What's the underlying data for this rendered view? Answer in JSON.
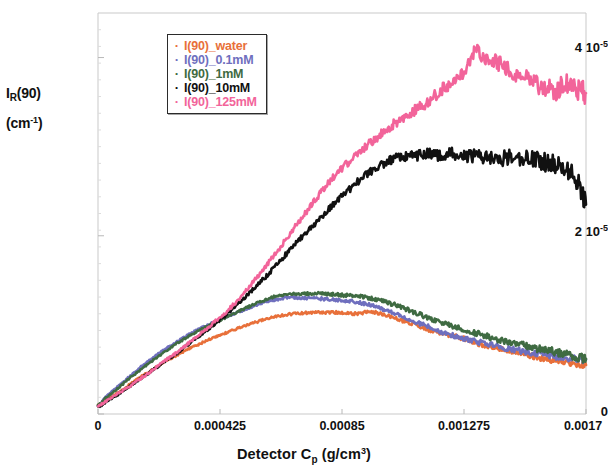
{
  "chart_data": {
    "type": "line",
    "title": "",
    "xlabel": "Detector C_p (g/cm^3)",
    "xlabel_parts": {
      "pre": "Detector C",
      "sub": "p",
      "mid": " (g/cm",
      "sup": "3",
      "post": ")"
    },
    "ylabel": "I_R(90) (cm^-1)",
    "ylabel_parts": {
      "line1_pre": "I",
      "line1_sub": "R",
      "line1_post": "(90)",
      "line2_pre": "(cm",
      "line2_sup": "-1",
      "line2_post": ")"
    },
    "xlim": [
      0,
      0.0017
    ],
    "ylim": [
      0,
      4.5e-05
    ],
    "grid": false,
    "xticks": [
      0,
      0.000425,
      0.00085,
      0.001275,
      0.0017
    ],
    "xticklabels": [
      "0",
      "0.000425",
      "0.00085",
      "0.001275",
      "0.0017"
    ],
    "yticks": [
      0,
      2e-05,
      4e-05
    ],
    "yticklabels": [
      "0",
      "2 10-5",
      "4 10-5"
    ],
    "ytick_display": [
      {
        "mantissa": "0",
        "exp": ""
      },
      {
        "mantissa": "2 10",
        "exp": "-5"
      },
      {
        "mantissa": "4 10",
        "exp": "-5"
      }
    ],
    "legend_position": "upper left inside",
    "series": [
      {
        "name": "I(90)_water",
        "color": "#e8703a",
        "x": [
          0,
          3e-05,
          7e-05,
          0.00011,
          0.00015,
          0.00019,
          0.00023,
          0.00027,
          0.00031,
          0.00035,
          0.00039,
          0.00043,
          0.00047,
          0.00051,
          0.00055,
          0.00059,
          0.00063,
          0.00067,
          0.00071,
          0.00075,
          0.00079,
          0.00083,
          0.00087,
          0.00091,
          0.00095,
          0.00099,
          0.00103,
          0.00107,
          0.00111,
          0.00115,
          0.00119,
          0.00123,
          0.00127,
          0.00131,
          0.00135,
          0.00139,
          0.00143,
          0.00147,
          0.00151,
          0.00155,
          0.00159,
          0.00163,
          0.00167,
          0.0017
        ],
        "y": [
          1e-06,
          1.6e-06,
          2.4e-06,
          3.3e-06,
          4.2e-06,
          5e-06,
          5.8e-06,
          6.5e-06,
          7.2e-06,
          7.8e-06,
          8.4e-06,
          8.9e-06,
          9.4e-06,
          9.9e-06,
          1.03e-05,
          1.07e-05,
          1.1e-05,
          1.12e-05,
          1.13e-05,
          1.14e-05,
          1.14e-05,
          1.14e-05,
          1.13e-05,
          1.13e-05,
          1.15e-05,
          1.12e-05,
          1.08e-05,
          1.04e-05,
          1e-05,
          9.5e-06,
          9.1e-06,
          8.8e-06,
          8.5e-06,
          8e-06,
          7.7e-06,
          7.4e-06,
          7.1e-06,
          6.8e-06,
          6.5e-06,
          6.2e-06,
          6e-06,
          5.8e-06,
          5.6e-06,
          5.5e-06
        ]
      },
      {
        "name": "I(90)_0.1mM",
        "color": "#6f6fbe",
        "x": [
          0,
          3e-05,
          7e-05,
          0.00011,
          0.00015,
          0.00019,
          0.00023,
          0.00027,
          0.00031,
          0.00035,
          0.00039,
          0.00043,
          0.00047,
          0.00051,
          0.00055,
          0.00059,
          0.00063,
          0.00067,
          0.00071,
          0.00075,
          0.00079,
          0.00083,
          0.00087,
          0.00091,
          0.00095,
          0.00099,
          0.00103,
          0.00107,
          0.00111,
          0.00115,
          0.00119,
          0.00123,
          0.00127,
          0.00131,
          0.00135,
          0.00139,
          0.00143,
          0.00147,
          0.00151,
          0.00155,
          0.00159,
          0.00163,
          0.00167,
          0.0017
        ],
        "y": [
          1e-06,
          2e-06,
          3.1e-06,
          4.2e-06,
          5.3e-06,
          6.3e-06,
          7.2e-06,
          8e-06,
          8.8e-06,
          9.5e-06,
          1.01e-05,
          1.07e-05,
          1.12e-05,
          1.17e-05,
          1.22e-05,
          1.26e-05,
          1.29e-05,
          1.31e-05,
          1.3e-05,
          1.3e-05,
          1.29e-05,
          1.28e-05,
          1.27e-05,
          1.25e-05,
          1.22e-05,
          1.18e-05,
          1.13e-05,
          1.08e-05,
          1.03e-05,
          9.8e-06,
          9.3e-06,
          8.9e-06,
          8.5e-06,
          8.2e-06,
          7.9e-06,
          7.6e-06,
          7.3e-06,
          7.1e-06,
          6.9e-06,
          6.7e-06,
          6.5e-06,
          6.3e-06,
          6.2e-06,
          6.1e-06
        ]
      },
      {
        "name": "I(90)_1mM",
        "color": "#3f6b42",
        "x": [
          0,
          3e-05,
          7e-05,
          0.00011,
          0.00015,
          0.00019,
          0.00023,
          0.00027,
          0.00031,
          0.00035,
          0.00039,
          0.00043,
          0.00047,
          0.00051,
          0.00055,
          0.00059,
          0.00063,
          0.00067,
          0.00071,
          0.00075,
          0.00079,
          0.00083,
          0.00087,
          0.00091,
          0.00095,
          0.00099,
          0.00103,
          0.00107,
          0.00111,
          0.00115,
          0.00119,
          0.00123,
          0.00127,
          0.00131,
          0.00135,
          0.00139,
          0.00143,
          0.00147,
          0.00151,
          0.00155,
          0.00159,
          0.00163,
          0.00167,
          0.0017
        ],
        "y": [
          1e-06,
          1.9e-06,
          2.9e-06,
          4e-06,
          5e-06,
          6e-06,
          6.9e-06,
          7.8e-06,
          8.6e-06,
          9.3e-06,
          1e-05,
          1.06e-05,
          1.12e-05,
          1.18e-05,
          1.24e-05,
          1.29e-05,
          1.33e-05,
          1.35e-05,
          1.35e-05,
          1.35e-05,
          1.35e-05,
          1.34e-05,
          1.33e-05,
          1.32e-05,
          1.3e-05,
          1.27e-05,
          1.23e-05,
          1.18e-05,
          1.13e-05,
          1.08e-05,
          1.03e-05,
          9.9e-06,
          9.5e-06,
          9.1e-06,
          8.8e-06,
          8.4e-06,
          8.1e-06,
          7.8e-06,
          7.5e-06,
          7.2e-06,
          7e-06,
          6.7e-06,
          6.4e-06,
          6.2e-06
        ]
      },
      {
        "name": "I(90)_10mM",
        "color": "#111111",
        "x": [
          0,
          3e-05,
          7e-05,
          0.00011,
          0.00015,
          0.00019,
          0.00023,
          0.00027,
          0.00031,
          0.00035,
          0.00039,
          0.00043,
          0.00047,
          0.00051,
          0.00055,
          0.00059,
          0.00063,
          0.00067,
          0.00071,
          0.00075,
          0.00079,
          0.00083,
          0.00087,
          0.00091,
          0.00095,
          0.00099,
          0.00103,
          0.00107,
          0.00111,
          0.00115,
          0.00119,
          0.00123,
          0.00127,
          0.00131,
          0.00135,
          0.00139,
          0.00143,
          0.00147,
          0.00151,
          0.00155,
          0.00159,
          0.00163,
          0.00167,
          0.0017
        ],
        "y": [
          8e-07,
          1.4e-06,
          2.2e-06,
          3.1e-06,
          4e-06,
          4.9e-06,
          5.8e-06,
          6.7e-06,
          7.7e-06,
          8.7e-06,
          9.7e-06,
          1.07e-05,
          1.18e-05,
          1.3e-05,
          1.43e-05,
          1.56e-05,
          1.7e-05,
          1.85e-05,
          1.99e-05,
          2.12e-05,
          2.25e-05,
          2.38e-05,
          2.5e-05,
          2.62e-05,
          2.72e-05,
          2.8e-05,
          2.86e-05,
          2.89e-05,
          2.9e-05,
          2.92e-05,
          2.9e-05,
          2.92e-05,
          2.89e-05,
          2.9e-05,
          2.88e-05,
          2.86e-05,
          2.88e-05,
          2.85e-05,
          2.87e-05,
          2.83e-05,
          2.8e-05,
          2.76e-05,
          2.6e-05,
          2.35e-05
        ]
      },
      {
        "name": "I(90)_125mM",
        "color": "#f2649a",
        "x": [
          0,
          3e-05,
          7e-05,
          0.00011,
          0.00015,
          0.00019,
          0.00023,
          0.00027,
          0.00031,
          0.00035,
          0.00039,
          0.00043,
          0.00047,
          0.00051,
          0.00055,
          0.00059,
          0.00063,
          0.00067,
          0.00071,
          0.00075,
          0.00079,
          0.00083,
          0.00087,
          0.00091,
          0.00095,
          0.00099,
          0.00103,
          0.00107,
          0.00111,
          0.00115,
          0.00119,
          0.00123,
          0.00127,
          0.00131,
          0.00135,
          0.00139,
          0.00143,
          0.00147,
          0.00151,
          0.00155,
          0.00159,
          0.00163,
          0.00167,
          0.0017
        ],
        "y": [
          9e-07,
          1.5e-06,
          2.3e-06,
          3.1e-06,
          4e-06,
          4.9e-06,
          5.9e-06,
          6.8e-06,
          7.8e-06,
          8.8e-06,
          9.9e-06,
          1.1e-05,
          1.22e-05,
          1.36e-05,
          1.52e-05,
          1.68e-05,
          1.85e-05,
          2.03e-05,
          2.2e-05,
          2.37e-05,
          2.54e-05,
          2.69e-05,
          2.82e-05,
          2.93e-05,
          3.05e-05,
          3.15e-05,
          3.25e-05,
          3.33e-05,
          3.42e-05,
          3.5e-05,
          3.62e-05,
          3.7e-05,
          3.8e-05,
          4.05e-05,
          4e-05,
          3.95e-05,
          3.85e-05,
          3.8e-05,
          3.72e-05,
          3.68e-05,
          3.62e-05,
          3.7e-05,
          3.65e-05,
          3.6e-05
        ]
      }
    ]
  },
  "legend": {
    "items": [
      {
        "marker": "·",
        "label": "I(90)_water",
        "color": "#e8703a"
      },
      {
        "marker": "·",
        "label": "I(90)_0.1mM",
        "color": "#6f6fbe"
      },
      {
        "marker": "·",
        "label": "I(90)_1mM",
        "color": "#3f6b42"
      },
      {
        "marker": "·",
        "label": "I(90)_10mM",
        "color": "#111111"
      },
      {
        "marker": "·",
        "label": "I(90)_125mM",
        "color": "#f2649a"
      }
    ]
  },
  "axes": {
    "ylabel_line1_pre": "I",
    "ylabel_line1_sub": "R",
    "ylabel_line1_post": "(90)",
    "ylabel_line2_pre": "(cm",
    "ylabel_line2_sup": "-1",
    "ylabel_line2_post": ")",
    "xlabel_pre": "Detector C",
    "xlabel_sub": "p",
    "xlabel_mid": " (g/cm",
    "xlabel_sup": "3",
    "xlabel_post": ")"
  }
}
